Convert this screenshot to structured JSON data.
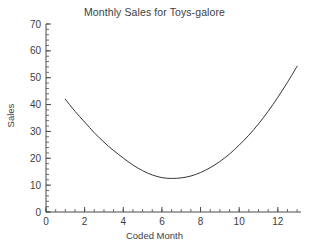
{
  "chart_data": {
    "type": "line",
    "title": "Monthly Sales for Toys-galore",
    "xlabel": "Coded Month",
    "ylabel": "Sales",
    "xlim": [
      0,
      13.2
    ],
    "ylim": [
      0,
      70
    ],
    "grid": false,
    "legend": "none",
    "x_ticks": [
      0,
      2,
      4,
      6,
      8,
      10,
      12
    ],
    "x_tick_labels": [
      "0",
      "2",
      "4",
      "6",
      "8",
      "10",
      "12"
    ],
    "x_minor_step": 0.5,
    "y_ticks": [
      0,
      10,
      20,
      30,
      40,
      50,
      60,
      70
    ],
    "y_tick_labels": [
      "0",
      "10",
      "20",
      "30",
      "40",
      "50",
      "60",
      "70"
    ],
    "y_minor_step": 2,
    "line_color": "#353535",
    "series": [
      {
        "name": "Sales",
        "x": [
          1.0,
          1.5,
          2.0,
          2.5,
          3.0,
          3.5,
          4.0,
          4.5,
          5.0,
          5.5,
          6.0,
          6.5,
          7.0,
          7.5,
          8.0,
          8.5,
          9.0,
          9.5,
          10.0,
          10.5,
          11.0,
          11.5,
          12.0,
          12.5,
          13.0
        ],
        "values": [
          42.0,
          37.5,
          33.5,
          29.5,
          26.0,
          22.9,
          20.1,
          17.5,
          15.4,
          13.8,
          12.8,
          12.5,
          12.7,
          13.4,
          14.7,
          16.5,
          18.8,
          21.6,
          24.9,
          28.6,
          32.8,
          37.5,
          42.7,
          48.3,
          54.3
        ]
      }
    ]
  }
}
